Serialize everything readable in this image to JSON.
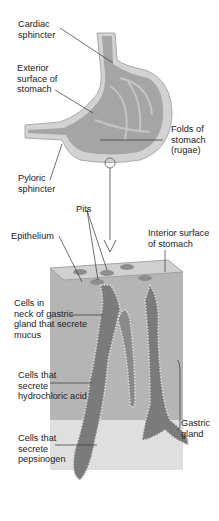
{
  "diagram": {
    "labels": {
      "cardiac_sphincter": "Cardiac\nsphincter",
      "exterior_surface": "Exterior\nsurface of\nstomach",
      "folds": "Folds of\nstomach\n(rugae)",
      "pyloric_sphincter": "Pyloric\nsphincter",
      "pits": "Pits",
      "epithelium": "Epithelium",
      "interior_surface": "Interior surface\nof stomach",
      "neck_cells": "Cells in\nneck of gastric\ngland that secrete\nmucus",
      "hcl_cells": "Cells that\nsecrete\nhydrochloric acid",
      "pepsinogen_cells": "Cells that\nsecrete\npepsinogen",
      "gastric_gland": "Gastric\ngland"
    },
    "colors": {
      "outer": "#c8c8c8",
      "inner": "#9a9a9a",
      "dark": "#6e6e6e",
      "line": "#333333"
    }
  }
}
